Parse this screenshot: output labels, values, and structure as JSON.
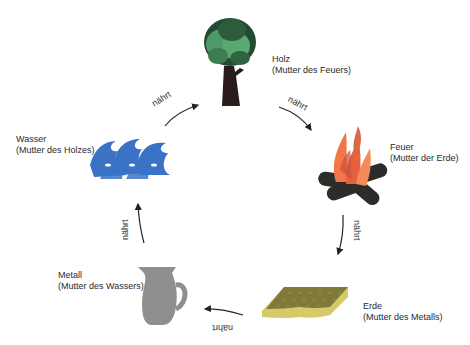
{
  "diagram": {
    "type": "cycle",
    "title": "",
    "relation_label": "nährt",
    "elements": [
      {
        "id": "holz",
        "name": "Holz",
        "role": "(Mutter des Feuers)",
        "icon": "tree-icon",
        "color": "#3d8a55"
      },
      {
        "id": "feuer",
        "name": "Feuer",
        "role": "(Mutter der Erde)",
        "icon": "campfire-icon",
        "color": "#f07040"
      },
      {
        "id": "erde",
        "name": "Erde",
        "role": "(Mutter des Metalls)",
        "icon": "earth-slab-icon",
        "color": "#8a8540"
      },
      {
        "id": "metall",
        "name": "Metall",
        "role": "(Mutter des Wassers)",
        "icon": "pitcher-icon",
        "color": "#8c8c8c"
      },
      {
        "id": "wasser",
        "name": "Wasser",
        "role": "(Mutter des Holzes)",
        "icon": "waves-icon",
        "color": "#3a72c6"
      }
    ],
    "arrows": [
      {
        "from": "wasser",
        "to": "holz",
        "label": "nährt"
      },
      {
        "from": "holz",
        "to": "feuer",
        "label": "nährt"
      },
      {
        "from": "feuer",
        "to": "erde",
        "label": "nährt"
      },
      {
        "from": "erde",
        "to": "metall",
        "label": "nährt"
      },
      {
        "from": "metall",
        "to": "wasser",
        "label": "nährt"
      }
    ]
  }
}
